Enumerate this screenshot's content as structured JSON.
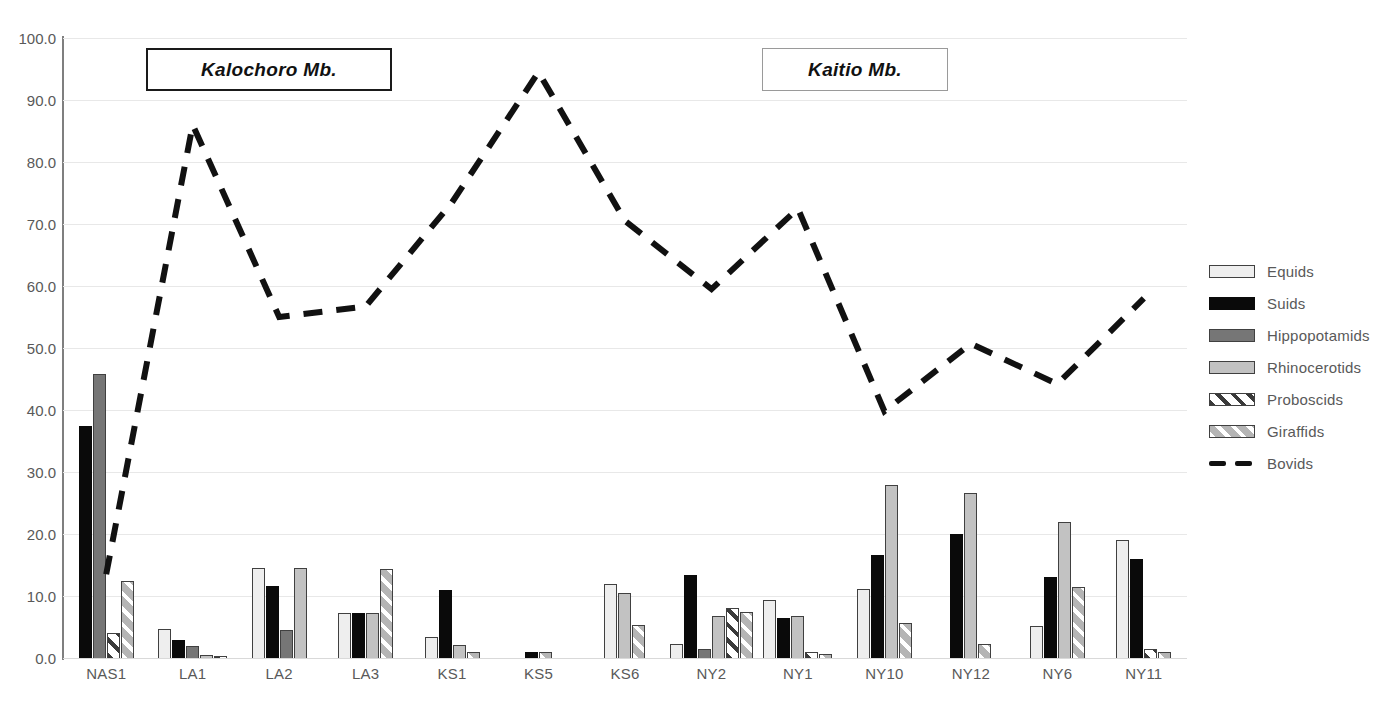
{
  "annotations": {
    "member_boxes": [
      {
        "name": "kalochoro",
        "label": "Kalochoro Mb."
      },
      {
        "name": "kaitio",
        "label": "Kaitio Mb."
      }
    ]
  },
  "legend": {
    "position": "right",
    "entries": [
      {
        "key": "equids",
        "label": "Equids",
        "swatch": "solid-light-gray",
        "color": "#eeeeee"
      },
      {
        "key": "suids",
        "label": "Suids",
        "swatch": "solid-black",
        "color": "#0a0a0a"
      },
      {
        "key": "hippopotamids",
        "label": "Hippopotamids",
        "swatch": "solid-dark-gray",
        "color": "#767676"
      },
      {
        "key": "rhinocerotids",
        "label": "Rhinocerotids",
        "swatch": "solid-medium-gray",
        "color": "#c2c2c2"
      },
      {
        "key": "proboscids",
        "label": "Proboscids",
        "swatch": "dark-diagonal-hatch",
        "color": "#3a3a3a"
      },
      {
        "key": "giraffids",
        "label": "Giraffids",
        "swatch": "light-diagonal-hatch",
        "color": "#b5b5b5"
      },
      {
        "key": "bovids",
        "label": "Bovids",
        "swatch": "dashed-line",
        "color": "#111111"
      }
    ]
  },
  "chart_data": {
    "type": "bar",
    "title": "",
    "xlabel": "",
    "ylabel": "",
    "ylim": [
      0,
      100
    ],
    "ytick_step": 10,
    "grid": true,
    "yticks": [
      "0.0",
      "10.0",
      "20.0",
      "30.0",
      "40.0",
      "50.0",
      "60.0",
      "70.0",
      "80.0",
      "90.0",
      "100.0"
    ],
    "categories": [
      "NAS1",
      "LA1",
      "LA2",
      "LA3",
      "KS1",
      "KS5",
      "KS6",
      "NY2",
      "NY1",
      "NY10",
      "NY12",
      "NY6",
      "NY11"
    ],
    "series": [
      {
        "name": "Equids",
        "key": "equids",
        "type": "bar",
        "values": [
          0,
          4.7,
          14.5,
          7.2,
          3.4,
          0,
          11.9,
          2.2,
          9.4,
          11.1,
          0,
          5.2,
          19.0
        ]
      },
      {
        "name": "Suids",
        "key": "suids",
        "type": "bar",
        "values": [
          37.5,
          2.9,
          11.6,
          7.2,
          11.0,
          0.9,
          0,
          13.4,
          6.4,
          16.6,
          20.0,
          13.0,
          15.9
        ]
      },
      {
        "name": "Hippopotamids",
        "key": "hippopotamids",
        "type": "bar",
        "values": [
          45.8,
          2.0,
          4.5,
          0,
          0,
          0,
          0,
          1.5,
          0,
          0,
          0,
          0,
          0
        ]
      },
      {
        "name": "Rhinocerotids",
        "key": "rhinocerotids",
        "type": "bar",
        "values": [
          0,
          0.5,
          14.5,
          7.2,
          2.1,
          0,
          10.5,
          6.7,
          6.8,
          27.9,
          26.6,
          22.0,
          0
        ]
      },
      {
        "name": "Proboscids",
        "key": "proboscids",
        "type": "bar",
        "values": [
          4.0,
          0.3,
          0,
          0,
          0,
          0,
          0,
          8.0,
          1.0,
          0,
          0,
          0,
          1.5
        ]
      },
      {
        "name": "Giraffids",
        "key": "giraffids",
        "type": "bar",
        "values": [
          12.4,
          0,
          0,
          14.3,
          1.0,
          1.0,
          5.3,
          7.5,
          0.7,
          5.6,
          2.2,
          11.5,
          1.0
        ]
      },
      {
        "name": "Bovids",
        "key": "bovids",
        "type": "line",
        "values": [
          13.5,
          86.0,
          55.0,
          56.7,
          73.5,
          94.5,
          70.5,
          59.5,
          72.5,
          39.8,
          50.7,
          44.2,
          58.0
        ]
      }
    ]
  }
}
